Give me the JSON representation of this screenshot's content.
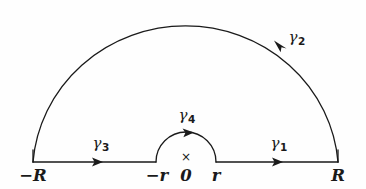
{
  "figure": {
    "kind": "complex-contour-diagram",
    "stroke_color": "#1a1a1a",
    "background_color": "#fefefe",
    "stroke_width": 1.3
  },
  "geometry": {
    "center_x": 186,
    "baseline_y": 162,
    "outer_radius": 153,
    "inner_radius": 30
  },
  "paths": [
    {
      "id": "gamma1",
      "label": "γ",
      "subscript": "1",
      "shape": "segment",
      "from": "r",
      "to": "R",
      "direction": "rightward",
      "label_x": 279,
      "label_y": 136,
      "arrow_x": 277,
      "arrow_y": 162
    },
    {
      "id": "gamma2",
      "label": "γ",
      "subscript": "2",
      "shape": "arc",
      "from": "R",
      "to": "-R",
      "direction": "counterclockwise",
      "label_x": 297,
      "label_y": 30,
      "arrow_x": 281,
      "arrow_y": 46
    },
    {
      "id": "gamma3",
      "label": "γ",
      "subscript": "3",
      "shape": "segment",
      "from": "-R",
      "to": "-r",
      "direction": "rightward",
      "label_x": 101,
      "label_y": 136,
      "arrow_x": 97,
      "arrow_y": 162
    },
    {
      "id": "gamma4",
      "label": "γ",
      "subscript": "4",
      "shape": "arc",
      "from": "-r",
      "to": "r",
      "direction": "clockwise-over-origin",
      "label_x": 187,
      "label_y": 108,
      "arrow_x": 189,
      "arrow_y": 132
    }
  ],
  "axis_labels": [
    {
      "id": "minus-R",
      "text": "−R",
      "x": 33,
      "y": 168
    },
    {
      "id": "minus-r",
      "text": "−r",
      "x": 157,
      "y": 168
    },
    {
      "id": "zero",
      "text": "0",
      "x": 186,
      "y": 168
    },
    {
      "id": "r",
      "text": "r",
      "x": 216,
      "y": 168
    },
    {
      "id": "R",
      "text": "R",
      "x": 338,
      "y": 168
    }
  ],
  "pole": {
    "id": "pole-at-origin",
    "symbol": "×",
    "x": 186,
    "y": 151
  }
}
